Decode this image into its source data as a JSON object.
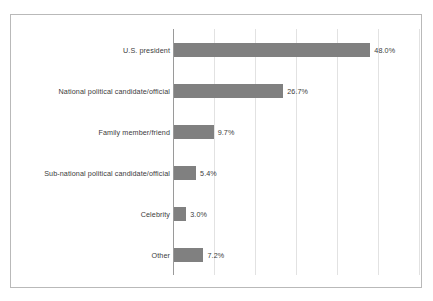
{
  "chart_data": {
    "type": "bar",
    "orientation": "horizontal",
    "title": "",
    "subtitle": "",
    "xlabel": "",
    "ylabel": "",
    "xlim": [
      0,
      60
    ],
    "grid": true,
    "gridline_values": [
      10,
      20,
      30,
      40,
      50,
      60
    ],
    "legend": null,
    "bar_color": "#808080",
    "axis_color": "#9a9a9a",
    "gridline_color": "#e2e2e2",
    "border_color": "#b9b9b9",
    "categories": [
      "U.S. president",
      "National political candidate/official",
      "Family member/friend",
      "Sub-national political candidate/official",
      "Celebrity",
      "Other"
    ],
    "values": [
      48.0,
      26.7,
      9.7,
      5.4,
      3.0,
      7.2
    ],
    "value_labels": [
      "48.0%",
      "26.7%",
      "9.7%",
      "5.4%",
      "3.0%",
      "7.2%"
    ]
  }
}
